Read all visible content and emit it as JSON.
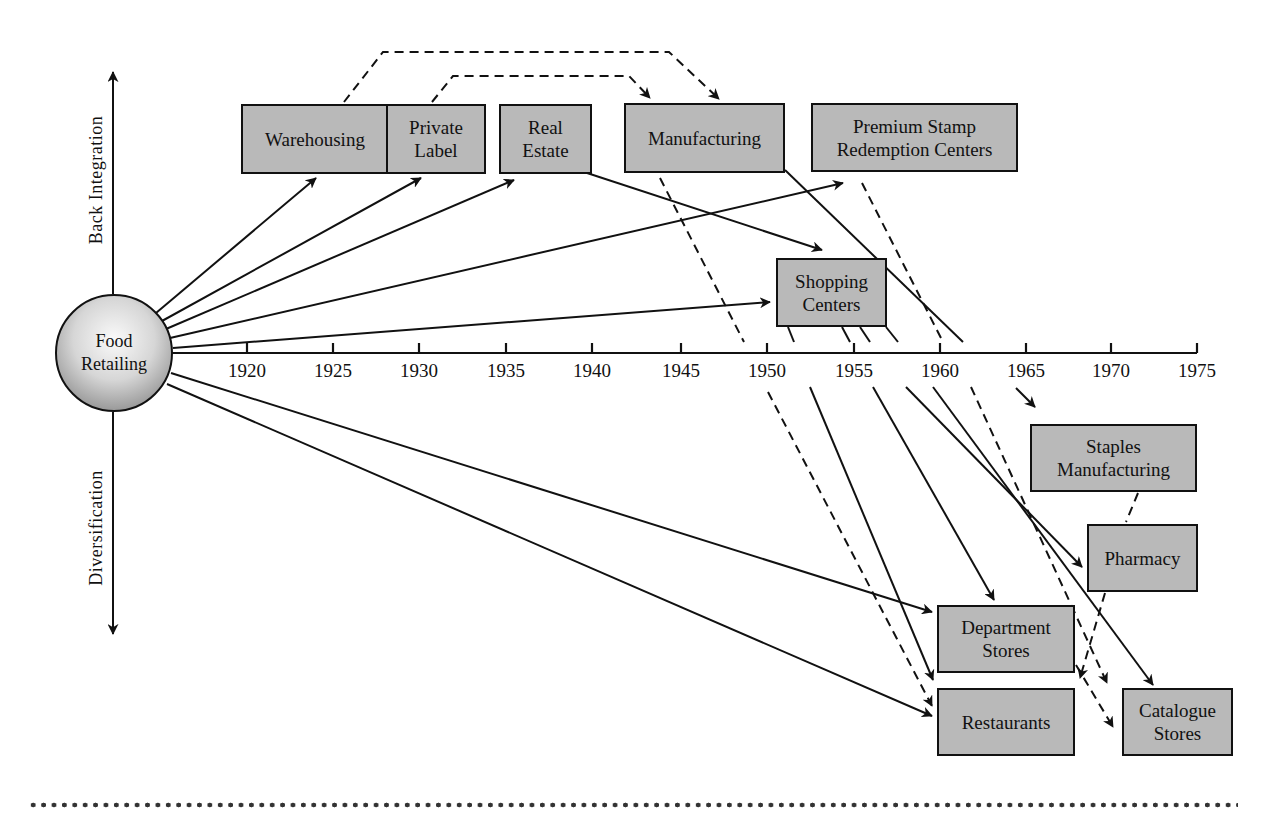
{
  "diagram": {
    "hub": {
      "label": "Food\nRetailing"
    },
    "axis_labels": {
      "up": "Back Integration",
      "down": "Diversification"
    },
    "timeline": {
      "years": [
        "1920",
        "1925",
        "1930",
        "1935",
        "1940",
        "1945",
        "1950",
        "1955",
        "1960",
        "1965",
        "1970",
        "1975"
      ]
    },
    "boxes": {
      "warehousing": "Warehousing",
      "private_label": "Private\nLabel",
      "real_estate": "Real\nEstate",
      "manufacturing": "Manufacturing",
      "premium_stamp": "Premium Stamp\nRedemption Centers",
      "shopping_centers": "Shopping\nCenters",
      "staples_manufacturing": "Staples\nManufacturing",
      "pharmacy": "Pharmacy",
      "department_stores": "Department\nStores",
      "restaurants": "Restaurants",
      "catalogue_stores": "Catalogue\nStores"
    },
    "colors": {
      "box_fill": "#b9b9b9",
      "stroke": "#111111",
      "background": "#ffffff"
    }
  }
}
